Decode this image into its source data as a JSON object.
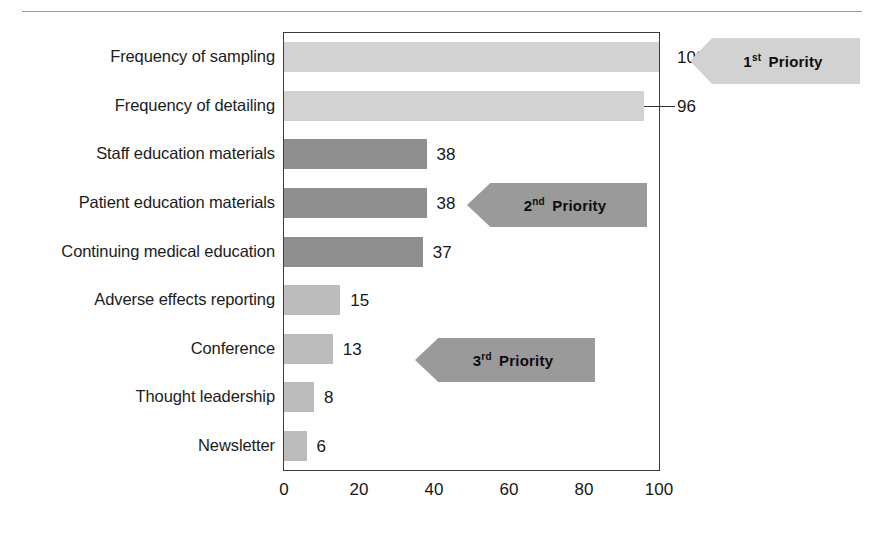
{
  "figure": {
    "top_rule": true
  },
  "chart_data": {
    "type": "bar",
    "orientation": "horizontal",
    "title": "",
    "xlabel": "",
    "ylabel": "",
    "xlim": [
      0,
      100
    ],
    "xticks": [
      0,
      20,
      40,
      60,
      80,
      100
    ],
    "xtick_labels": [
      "0",
      "20",
      "40",
      "60",
      "80",
      "100"
    ],
    "grid": false,
    "legend": "none",
    "categories": [
      "Frequency of sampling",
      "Frequency of detailing",
      "Staff education materials",
      "Patient education materials",
      "Continuing medical education",
      "Adverse effects reporting",
      "Conference",
      "Thought leadership",
      "Newsletter"
    ],
    "values": [
      100,
      96,
      38,
      38,
      37,
      15,
      13,
      8,
      6
    ],
    "value_labels": [
      "100",
      "96",
      "38",
      "38",
      "37",
      "15",
      "13",
      "8",
      "6"
    ],
    "bar_colors": [
      "#d2d2d2",
      "#d2d2d2",
      "#8f8f8f",
      "#8f8f8f",
      "#8f8f8f",
      "#bcbcbc",
      "#bcbcbc",
      "#bcbcbc",
      "#bcbcbc"
    ],
    "annotations": [
      {
        "name": "first-priority",
        "ordinal": "1",
        "ordinal_suffix": "st",
        "text": "Priority",
        "color": "#d2d2d2",
        "points_to": "Frequency of sampling"
      },
      {
        "name": "second-priority",
        "ordinal": "2",
        "ordinal_suffix": "nd",
        "text": "Priority",
        "color": "#9a9a9a",
        "points_to": "Patient education materials"
      },
      {
        "name": "third-priority",
        "ordinal": "3",
        "ordinal_suffix": "rd",
        "text": "Priority",
        "color": "#9a9a9a",
        "points_to": "Conference"
      }
    ]
  },
  "colors": {
    "frame": "#3b3b3b",
    "text": "#1a1a1a",
    "background": "#ffffff"
  }
}
